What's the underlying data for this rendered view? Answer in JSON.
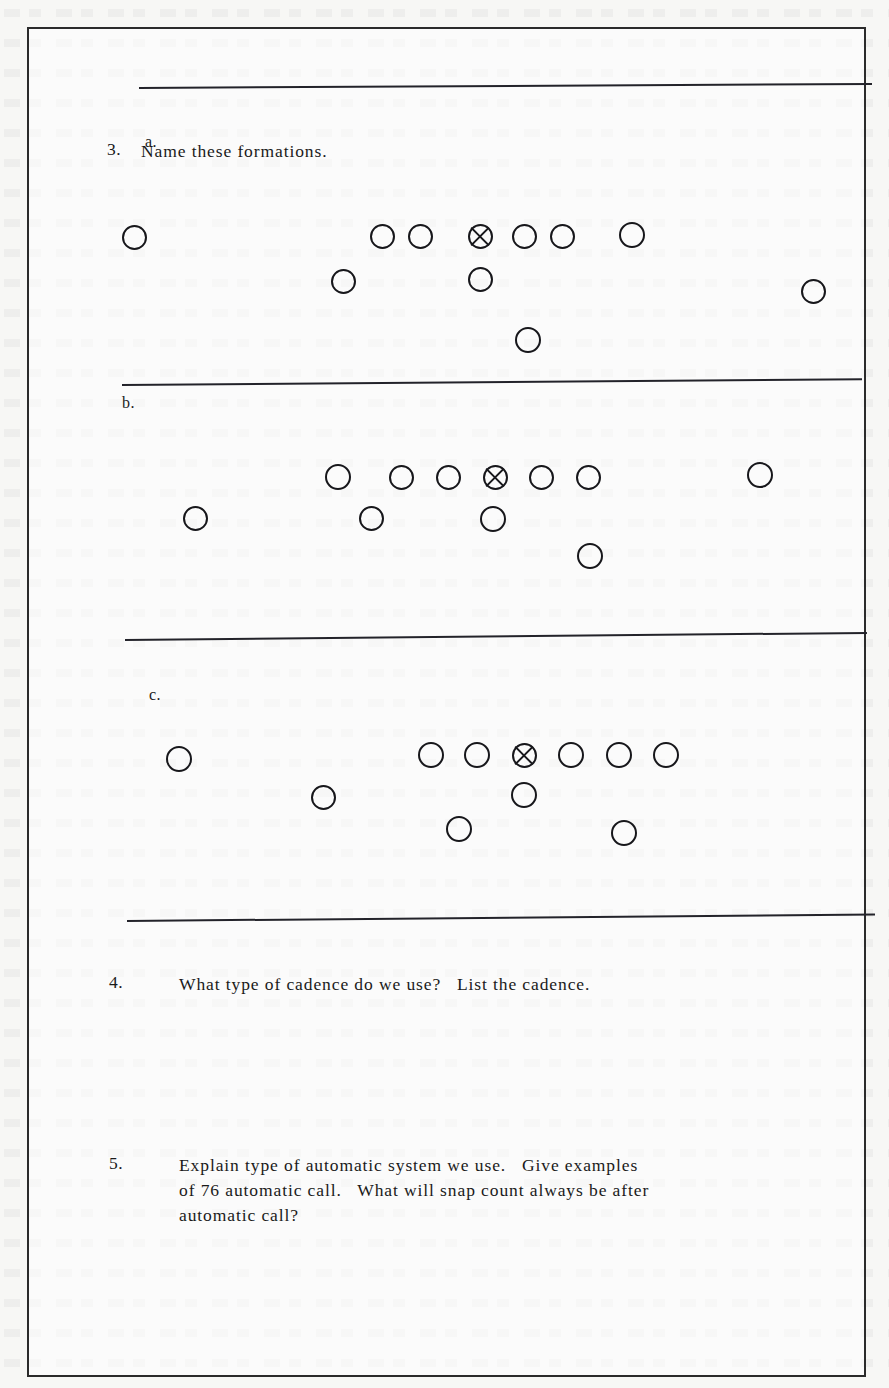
{
  "document": {
    "kind": "worksheet-page",
    "paper_color": "#f7f7f5",
    "ink_color": "#1a1a1a",
    "border_color": "#2b2b2b"
  },
  "questions": [
    {
      "number": "3.",
      "text": "Name these formations.",
      "subparts": [
        {
          "label": "a."
        },
        {
          "label": "b."
        },
        {
          "label": "c."
        }
      ]
    },
    {
      "number": "4.",
      "lines": [
        "What type of cadence do we use?   List the cadence."
      ]
    },
    {
      "number": "5.",
      "lines": [
        "Explain type of automatic system we use.   Give examples",
        "of 76 automatic call.   What will snap count always be after",
        "automatic call?"
      ]
    }
  ],
  "rules": [
    {
      "name": "rule-top",
      "x": 112,
      "y": 87,
      "width": 733,
      "tilt": -0.32
    },
    {
      "name": "rule-after-a",
      "x": 95,
      "y": 384,
      "width": 740,
      "tilt": -0.45
    },
    {
      "name": "rule-after-b",
      "x": 98,
      "y": 639,
      "width": 742,
      "tilt": -0.55
    },
    {
      "name": "rule-after-c",
      "x": 100,
      "y": 920,
      "width": 748,
      "tilt": -0.5
    }
  ],
  "diagrams": [
    {
      "name": "formation-a",
      "label": "a.",
      "label_x": 118,
      "label_y": 133,
      "players": [
        {
          "role": "split-end",
          "x": 107,
          "y": 237,
          "size": 25,
          "ball": false
        },
        {
          "role": "lineman",
          "x": 355,
          "y": 236,
          "size": 25,
          "ball": false
        },
        {
          "role": "lineman",
          "x": 393,
          "y": 236,
          "size": 25,
          "ball": false
        },
        {
          "role": "center",
          "x": 453,
          "y": 236,
          "size": 25,
          "ball": true
        },
        {
          "role": "lineman",
          "x": 497,
          "y": 236,
          "size": 25,
          "ball": false
        },
        {
          "role": "lineman",
          "x": 535,
          "y": 236,
          "size": 25,
          "ball": false
        },
        {
          "role": "tight-end",
          "x": 605,
          "y": 235,
          "size": 26,
          "ball": false
        },
        {
          "role": "back",
          "x": 316,
          "y": 281,
          "size": 25,
          "ball": false
        },
        {
          "role": "quarterback",
          "x": 453,
          "y": 279,
          "size": 25,
          "ball": false
        },
        {
          "role": "flanker",
          "x": 786,
          "y": 291,
          "size": 25,
          "ball": false
        },
        {
          "role": "back",
          "x": 501,
          "y": 340,
          "size": 26,
          "ball": false
        }
      ]
    },
    {
      "name": "formation-b",
      "label": "b.",
      "label_x": 95,
      "label_y": 394,
      "players": [
        {
          "role": "lineman",
          "x": 311,
          "y": 477,
          "size": 26,
          "ball": false
        },
        {
          "role": "lineman",
          "x": 374,
          "y": 477,
          "size": 25,
          "ball": false
        },
        {
          "role": "lineman",
          "x": 421,
          "y": 477,
          "size": 25,
          "ball": false
        },
        {
          "role": "center",
          "x": 468,
          "y": 477,
          "size": 25,
          "ball": true
        },
        {
          "role": "lineman",
          "x": 514,
          "y": 477,
          "size": 25,
          "ball": false
        },
        {
          "role": "lineman",
          "x": 561,
          "y": 477,
          "size": 25,
          "ball": false
        },
        {
          "role": "tight-end",
          "x": 733,
          "y": 475,
          "size": 26,
          "ball": false
        },
        {
          "role": "split-end",
          "x": 168,
          "y": 518,
          "size": 25,
          "ball": false
        },
        {
          "role": "back",
          "x": 344,
          "y": 518,
          "size": 25,
          "ball": false
        },
        {
          "role": "quarterback",
          "x": 466,
          "y": 519,
          "size": 26,
          "ball": false
        },
        {
          "role": "back",
          "x": 563,
          "y": 556,
          "size": 26,
          "ball": false
        }
      ]
    },
    {
      "name": "formation-c",
      "label": "c.",
      "label_x": 122,
      "label_y": 686,
      "players": [
        {
          "role": "split-end",
          "x": 152,
          "y": 759,
          "size": 26,
          "ball": false
        },
        {
          "role": "lineman",
          "x": 404,
          "y": 755,
          "size": 26,
          "ball": false
        },
        {
          "role": "lineman",
          "x": 450,
          "y": 755,
          "size": 26,
          "ball": false
        },
        {
          "role": "center",
          "x": 497,
          "y": 755,
          "size": 25,
          "ball": true
        },
        {
          "role": "lineman",
          "x": 544,
          "y": 755,
          "size": 26,
          "ball": false
        },
        {
          "role": "lineman",
          "x": 592,
          "y": 755,
          "size": 26,
          "ball": false
        },
        {
          "role": "tight-end",
          "x": 639,
          "y": 755,
          "size": 26,
          "ball": false
        },
        {
          "role": "back",
          "x": 296,
          "y": 797,
          "size": 25,
          "ball": false
        },
        {
          "role": "quarterback",
          "x": 497,
          "y": 795,
          "size": 26,
          "ball": false
        },
        {
          "role": "back",
          "x": 432,
          "y": 829,
          "size": 26,
          "ball": false
        },
        {
          "role": "back",
          "x": 597,
          "y": 833,
          "size": 26,
          "ball": false
        }
      ]
    }
  ],
  "layout": {
    "q3_num_x": 78,
    "q3_num_y": 110,
    "q3_text_x": 112,
    "q3_text_y": 110,
    "q4_num_x": 80,
    "q4_num_y": 943,
    "q4_text_x": 150,
    "q4_text_y": 943,
    "q5_num_x": 80,
    "q5_num_y": 1124,
    "q5_text_x": 150,
    "q5_text_y": 1124
  }
}
